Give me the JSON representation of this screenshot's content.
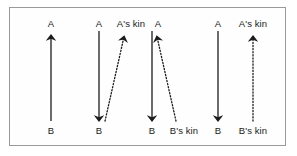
{
  "figure": {
    "type": "diagram",
    "width": 297,
    "height": 156,
    "background_color": "#ffffff",
    "frame_color": "#9a9a9a",
    "arrow_color": "#1b1b1b"
  },
  "labels": {
    "a": "A",
    "b": "B",
    "a_kin": "A's kin",
    "b_kin": "B's kin"
  },
  "top_labels": [
    {
      "text": "A",
      "x": 51
    },
    {
      "text": "A",
      "x": 99
    },
    {
      "text": "A's kin",
      "x": 131
    },
    {
      "text": "A",
      "x": 158
    },
    {
      "text": "A",
      "x": 218
    },
    {
      "text": "A's kin",
      "x": 253
    }
  ],
  "bottom_labels": [
    {
      "text": "B",
      "x": 51
    },
    {
      "text": "B",
      "x": 99
    },
    {
      "text": "B",
      "x": 152
    },
    {
      "text": "B's kin",
      "x": 184
    },
    {
      "text": "B",
      "x": 218
    },
    {
      "text": "B's kin",
      "x": 253
    }
  ],
  "arrows": [
    {
      "name": "panel1-b-to-a",
      "style": "solid",
      "from": [
        51,
        120
      ],
      "to": [
        51,
        36
      ],
      "direction": "up"
    },
    {
      "name": "panel2-a-to-b",
      "style": "solid",
      "from": [
        99,
        32
      ],
      "to": [
        99,
        120
      ],
      "direction": "down"
    },
    {
      "name": "panel2-b-to-a-kin",
      "style": "dotted",
      "from": [
        106,
        120
      ],
      "to": [
        124,
        36
      ],
      "direction": "up"
    },
    {
      "name": "panel3-a-to-b",
      "style": "solid",
      "from": [
        152,
        32
      ],
      "to": [
        152,
        120
      ],
      "direction": "down"
    },
    {
      "name": "panel3-b-kin-to-a",
      "style": "dotted",
      "from": [
        175,
        120
      ],
      "to": [
        157,
        36
      ],
      "direction": "up"
    },
    {
      "name": "panel4-a-to-b",
      "style": "solid",
      "from": [
        218,
        32
      ],
      "to": [
        218,
        120
      ],
      "direction": "down"
    },
    {
      "name": "panel4-b-kin-to-a-kin",
      "style": "dotted",
      "from": [
        253,
        120
      ],
      "to": [
        253,
        36
      ],
      "direction": "up"
    }
  ]
}
